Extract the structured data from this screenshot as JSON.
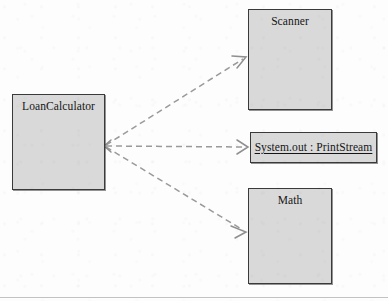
{
  "diagram": {
    "type": "uml-dependency-diagram",
    "canvas": {
      "width": 388,
      "height": 301,
      "background": "#fdfdfd"
    },
    "style": {
      "box_fill": "#d9d9d9",
      "box_border": "#3a3a3a",
      "edge_color": "#9a9a9a",
      "text_color": "#151515",
      "rule_color": "#c2c2c2"
    },
    "nodes": [
      {
        "id": "loan-calculator",
        "label": "LoanCalculator",
        "kind": "class",
        "x": 12,
        "y": 94,
        "width": 93,
        "height": 96
      },
      {
        "id": "scanner",
        "label": "Scanner",
        "kind": "class",
        "x": 248,
        "y": 9,
        "width": 84,
        "height": 101
      },
      {
        "id": "system-out",
        "label": "System.out : PrintStream",
        "kind": "object",
        "x": 250,
        "y": 132,
        "width": 127,
        "height": 31
      },
      {
        "id": "math",
        "label": "Math",
        "kind": "class",
        "x": 248,
        "y": 188,
        "width": 84,
        "height": 96
      }
    ],
    "edges": [
      {
        "id": "dep-scanner",
        "from": "loan-calculator",
        "to": "scanner",
        "kind": "dependency",
        "style": "dashed",
        "arrow": "open",
        "x1": 106,
        "y1": 145,
        "x2": 246,
        "y2": 57
      },
      {
        "id": "dep-system-out",
        "from": "loan-calculator",
        "to": "system-out",
        "kind": "dependency",
        "style": "dashed",
        "arrow": "open",
        "x1": 106,
        "y1": 146,
        "x2": 248,
        "y2": 147
      },
      {
        "id": "dep-math",
        "from": "loan-calculator",
        "to": "math",
        "kind": "dependency",
        "style": "dashed",
        "arrow": "open",
        "x1": 106,
        "y1": 147,
        "x2": 246,
        "y2": 232
      }
    ],
    "page_rule": {
      "y": 297
    }
  }
}
